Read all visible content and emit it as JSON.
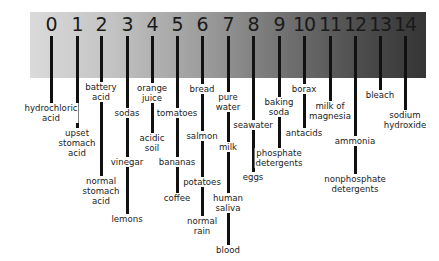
{
  "diagram": {
    "scale_numbers": [
      "0",
      "1",
      "2",
      "3",
      "4",
      "5",
      "6",
      "7",
      "8",
      "9",
      "10",
      "11",
      "12",
      "13",
      "14"
    ],
    "gradient_colors": {
      "acid_end": "#dadada",
      "base_end": "#353535"
    },
    "labels": {
      "ph0": [
        "hydrochloric\nacid"
      ],
      "ph1": [
        "upset\nstomach\nacid"
      ],
      "ph2": [
        "battery\nacid",
        "normal\nstomach\nacid"
      ],
      "ph3": [
        "sodas",
        "vinegar",
        "lemons"
      ],
      "ph4": [
        "orange\njuice",
        "acidic\nsoil"
      ],
      "ph5": [
        "tomatoes",
        "bananas",
        "coffee"
      ],
      "ph6": [
        "bread",
        "salmon",
        "potatoes",
        "normal\nrain"
      ],
      "ph7": [
        "pure\nwater",
        "milk",
        "human\nsaliva",
        "blood"
      ],
      "ph8": [
        "seawater",
        "eggs"
      ],
      "ph9": [
        "baking\nsoda",
        "phosphate\ndetergents"
      ],
      "ph10": [
        "borax",
        "antacids"
      ],
      "ph11": [
        "milk of\nmagnesia"
      ],
      "ph12": [
        "ammonia",
        "nonphosphate\ndetergents"
      ],
      "ph13": [
        "bleach"
      ],
      "ph14": [
        "sodium\nhydroxide"
      ]
    }
  }
}
